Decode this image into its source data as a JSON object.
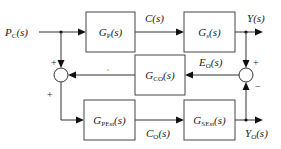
{
  "diagram": {
    "type": "block-diagram",
    "input": {
      "label": "P",
      "sub": "C",
      "arg": "(s)"
    },
    "blocks": [
      {
        "id": "gp",
        "name": "G",
        "sub": "P",
        "arg": "(s)"
      },
      {
        "id": "gs",
        "name": "G",
        "sub": "s",
        "arg": "(s)"
      },
      {
        "id": "gco",
        "name": "G",
        "sub": "CO",
        "arg": "(s)"
      },
      {
        "id": "gpest",
        "name": "G",
        "sub": "PEst",
        "arg": "(s)"
      },
      {
        "id": "gsest",
        "name": "G",
        "sub": "SEst",
        "arg": "(s)"
      }
    ],
    "signals": {
      "c": {
        "name": "C",
        "sub": "",
        "arg": "(s)"
      },
      "y": {
        "name": "Y",
        "sub": "",
        "arg": "(s)"
      },
      "eo": {
        "name": "E",
        "sub": "O",
        "arg": "(s)"
      },
      "co": {
        "name": "C",
        "sub": "O",
        "arg": "(s)"
      },
      "yo": {
        "name": "Y",
        "sub": "O",
        "arg": "(s)"
      }
    },
    "summing_junctions": {
      "left": {
        "top_sign": "+",
        "bottom_sign": "+"
      },
      "right": {
        "top_sign": "+",
        "bottom_sign": "−"
      }
    },
    "colors": {
      "line": "#333333",
      "box_border": "#444444",
      "text": "#222222",
      "marker": "#e8d89a"
    }
  }
}
